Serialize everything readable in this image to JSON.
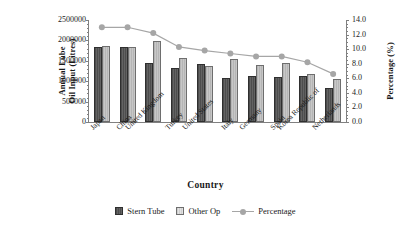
{
  "chart_data": {
    "type": "bar",
    "title": "",
    "xlabel": "Country",
    "ylabel": "Annual Lube Oil Input (Litres)",
    "ylabel_line1": "Annual Lube",
    "ylabel_line2": "Oil Input (Litres)",
    "y2label": "Percentage (%)",
    "categories": [
      "Japan",
      "China",
      "United Kingdom",
      "Turkey",
      "United States",
      "Italy",
      "Germany",
      "Spain",
      "Korea Republic of",
      "Netherlands"
    ],
    "series": [
      {
        "name": "Stern Tube",
        "type": "bar",
        "axis": "left",
        "color": "#595959",
        "values": [
          1835000,
          1838000,
          1450000,
          1330000,
          1410000,
          1090000,
          1140000,
          1105000,
          1120000,
          845000
        ]
      },
      {
        "name": "Other Op",
        "type": "bar",
        "axis": "left",
        "color": "#bfbfbf",
        "values": [
          1860000,
          1835000,
          1975000,
          1570000,
          1375000,
          1550000,
          1400000,
          1435000,
          1185000,
          1060000
        ]
      },
      {
        "name": "Percentage",
        "type": "line",
        "axis": "right",
        "color": "#a6a6a6",
        "values": [
          13.0,
          13.0,
          12.2,
          10.3,
          9.8,
          9.4,
          9.0,
          9.0,
          8.2,
          6.6
        ]
      }
    ],
    "ylim": [
      0,
      2500000
    ],
    "yticks": [
      0,
      500000,
      1000000,
      1500000,
      2000000,
      2500000
    ],
    "ytick_labels": [
      "0",
      "500000",
      "1000000",
      "1500000",
      "2000000",
      "2500000"
    ],
    "y2lim": [
      0,
      14
    ],
    "y2ticks": [
      0,
      2,
      4,
      6,
      8,
      10,
      12,
      14
    ],
    "y2tick_labels": [
      "0.0",
      "2.0",
      "4.0",
      "6.0",
      "8.0",
      "10.0",
      "12.0",
      "14.0"
    ],
    "grid": false,
    "legend_position": "bottom"
  },
  "legend": {
    "items": [
      {
        "label": "Stern Tube"
      },
      {
        "label": "Other Op"
      },
      {
        "label": "Percentage"
      }
    ]
  }
}
